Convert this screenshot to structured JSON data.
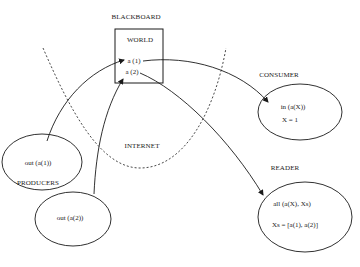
{
  "diagram": {
    "title": "BLACKBOARD",
    "blackboard": {
      "label": "BLACKBOARD",
      "box_label": "WORLD",
      "tuples": [
        "a (1)",
        "a (2)"
      ]
    },
    "regions": {
      "internet": "INTERNET"
    },
    "producers": {
      "label": "PRODUCERS",
      "nodes": [
        {
          "text": "out (a(1))"
        },
        {
          "text": "out (a(2))"
        }
      ]
    },
    "consumer": {
      "label": "CONSUMER",
      "lines": [
        "in (a(X))",
        "X = 1"
      ]
    },
    "reader": {
      "label": "READER",
      "lines": [
        "all (a(X), Xs)",
        "Xs = [a(1), a(2)]"
      ]
    },
    "edges": [
      {
        "from": "out (a(1))",
        "to": "a (1)"
      },
      {
        "from": "out (a(2))",
        "to": "a (2)"
      },
      {
        "from": "a (1)",
        "to": "CONSUMER"
      },
      {
        "from": "a (2)",
        "to": "READER"
      }
    ],
    "colors": {
      "stroke": "#1a1a1a",
      "background": "#ffffff"
    }
  }
}
